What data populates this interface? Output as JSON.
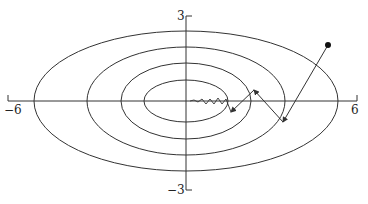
{
  "diagram": {
    "axes": {
      "x_min_label": "−6",
      "x_max_label": "6",
      "y_max_label": "3",
      "y_min_label": "−3"
    },
    "contours": [
      {
        "rx": 152,
        "ry": 70
      },
      {
        "rx": 99,
        "ry": 54
      },
      {
        "rx": 65,
        "ry": 38
      },
      {
        "rx": 42,
        "ry": 21
      }
    ],
    "start_point": {
      "x": 328,
      "y": 45
    },
    "path_points": "328,45 283,122 254,90 231,112 224,100 218,106 213,99 207,104 202,100 197,103 192,101",
    "colors": {
      "line": "#333333",
      "background": "#ffffff"
    }
  }
}
